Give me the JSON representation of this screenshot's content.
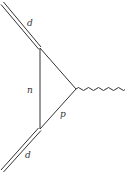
{
  "diagram": {
    "type": "feynman-diagram",
    "colors": {
      "line": "#333333",
      "background": "#ffffff"
    },
    "labels": {
      "top_line": "d",
      "bottom_line": "d",
      "internal_vertical": "n",
      "internal_lower": "p"
    },
    "vertices": {
      "top_left": [
        40,
        48
      ],
      "bottom_left": [
        40,
        129
      ],
      "right": [
        76,
        89
      ]
    },
    "edges": [
      {
        "id": "deuteron-in",
        "style": "double",
        "label": "d",
        "from": [
          2,
          3
        ],
        "to": [
          40,
          48
        ]
      },
      {
        "id": "neutron",
        "style": "single",
        "label": "n",
        "from": [
          40,
          48
        ],
        "to": [
          40,
          129
        ]
      },
      {
        "id": "upper-internal",
        "style": "single",
        "label": "",
        "from": [
          40,
          48
        ],
        "to": [
          76,
          89
        ]
      },
      {
        "id": "proton",
        "style": "single",
        "label": "p",
        "from": [
          40,
          129
        ],
        "to": [
          76,
          89
        ]
      },
      {
        "id": "deuteron-out",
        "style": "double",
        "label": "d",
        "from": [
          40,
          129
        ],
        "to": [
          2,
          171
        ]
      },
      {
        "id": "photon",
        "style": "wavy",
        "label": "",
        "from": [
          76,
          89
        ],
        "to": [
          122,
          89
        ]
      }
    ]
  }
}
